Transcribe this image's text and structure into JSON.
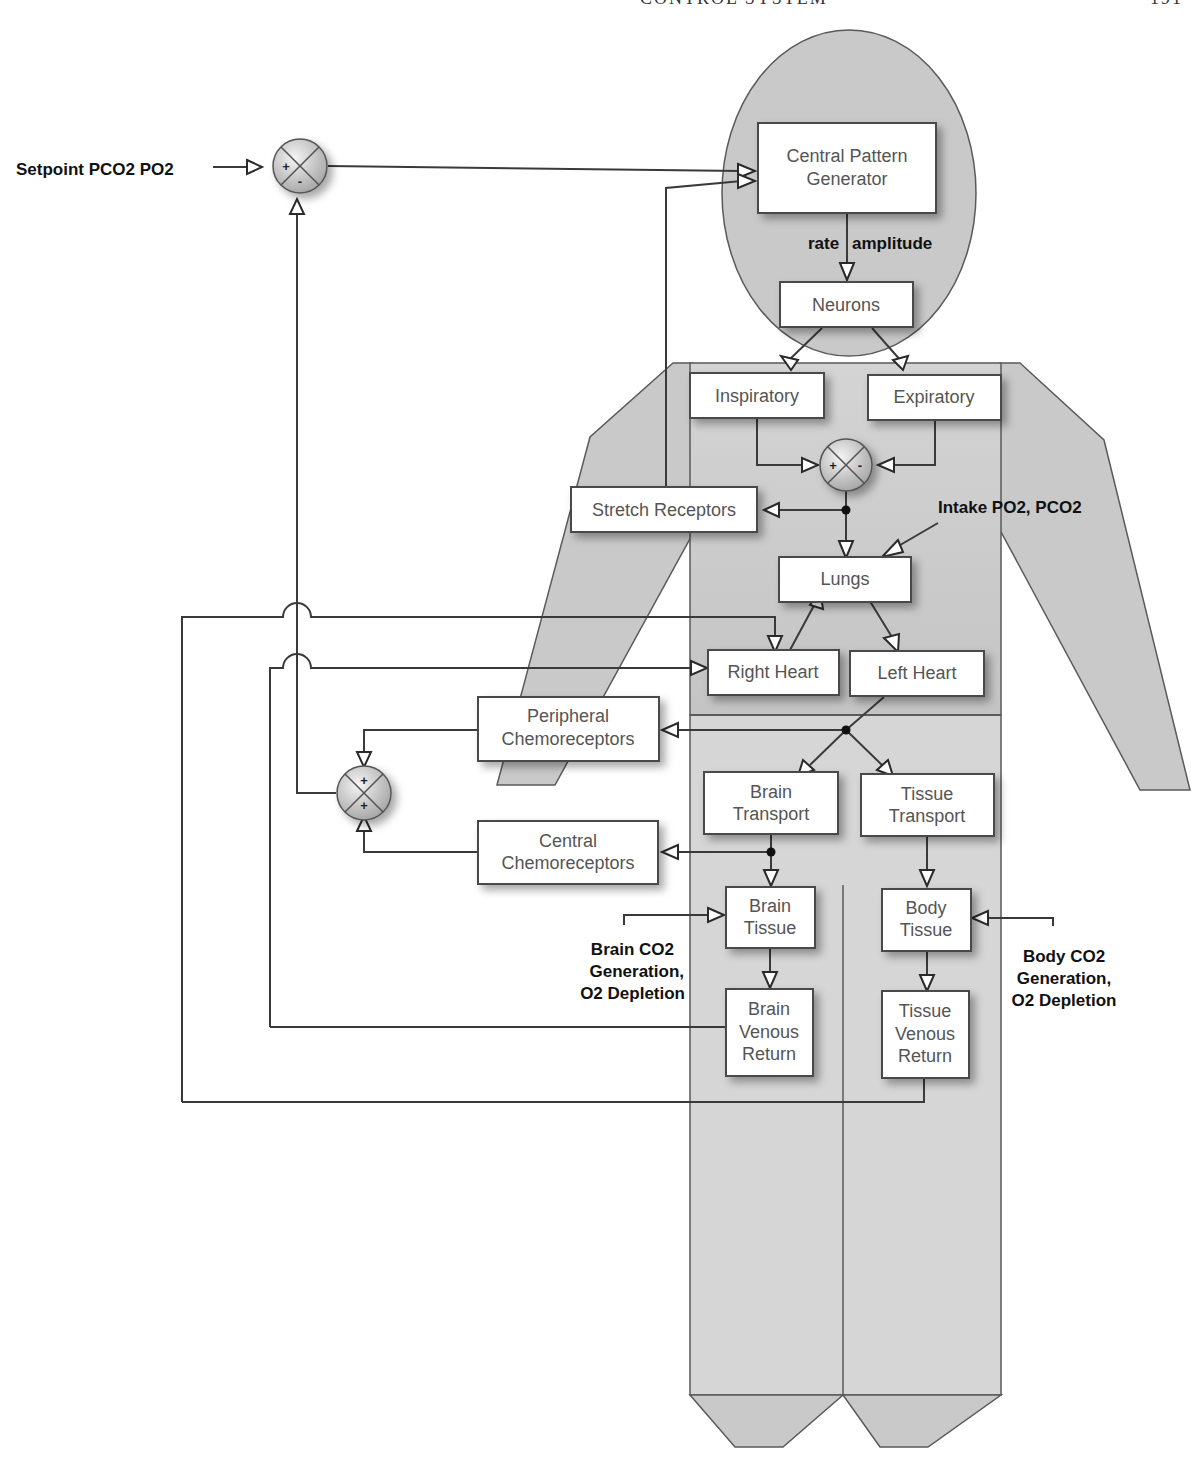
{
  "page_header": {
    "text": "CONTROL SYSTEM",
    "page_number": "191"
  },
  "labels": {
    "setpoint": "Setpoint PCO2 PO2",
    "rate": "rate",
    "amplitude": "amplitude",
    "intake": "Intake PO2, PCO2",
    "brain_gen": [
      "Brain CO2",
      "Generation,",
      "O2 Depletion"
    ],
    "body_gen": [
      "Body CO2",
      "Generation,",
      "O2 Depletion"
    ]
  },
  "blocks": {
    "cpg": [
      "Central Pattern",
      "Generator"
    ],
    "neurons": [
      "Neurons"
    ],
    "inspiratory": [
      "Inspiratory"
    ],
    "expiratory": [
      "Expiratory"
    ],
    "stretch": [
      "Stretch Receptors"
    ],
    "lungs": [
      "Lungs"
    ],
    "right_heart": [
      "Right Heart"
    ],
    "left_heart": [
      "Left Heart"
    ],
    "peripheral": [
      "Peripheral",
      "Chemoreceptors"
    ],
    "central": [
      "Central",
      "Chemoreceptors"
    ],
    "brain_transport": [
      "Brain",
      "Transport"
    ],
    "tissue_transport": [
      "Tissue",
      "Transport"
    ],
    "brain_tissue": [
      "Brain",
      "Tissue"
    ],
    "body_tissue": [
      "Body",
      "Tissue"
    ],
    "brain_venous": [
      "Brain",
      "Venous",
      "Return"
    ],
    "tissue_venous": [
      "Tissue",
      "Venous",
      "Return"
    ]
  },
  "summing_junctions": {
    "setpoint_sum": {
      "signs": [
        "+",
        "-"
      ]
    },
    "resp_sum": {
      "signs": [
        "+",
        "-"
      ]
    },
    "chemo_sum": {
      "signs": [
        "+",
        "+"
      ]
    }
  },
  "colors": {
    "body_fill": "#c9c9c9",
    "block_fill": "#ffffff",
    "wire": "#3a3a3a"
  }
}
